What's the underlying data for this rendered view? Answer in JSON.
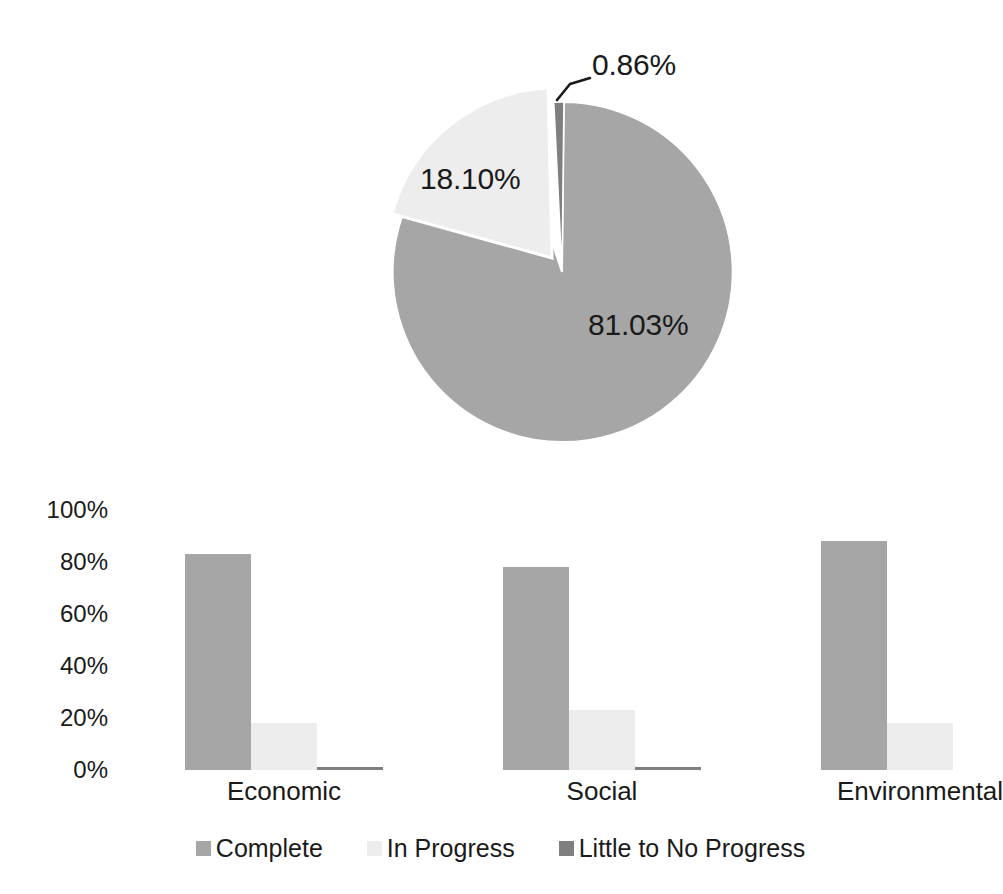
{
  "colors": {
    "complete": "#a6a6a6",
    "in_progress": "#ededed",
    "little_to_no_progress": "#7f7f7f",
    "slice_border": "#ffffff",
    "text": "#1a1a1a",
    "leader_line": "#1a1a1a",
    "background": "#ffffff"
  },
  "legend": {
    "position": "bottom",
    "items": [
      {
        "label": "Complete",
        "color": "#a6a6a6"
      },
      {
        "label": "In Progress",
        "color": "#ededed"
      },
      {
        "label": "Little to No Progress",
        "color": "#7f7f7f"
      }
    ]
  },
  "chart_data": [
    {
      "id": "pie",
      "type": "pie",
      "title": "",
      "exploded": true,
      "labels": [
        "Complete",
        "In Progress",
        "Little to No Progress"
      ],
      "values": [
        81.03,
        18.1,
        0.86
      ],
      "data_labels": [
        "81.03%",
        "18.10%",
        "0.86%"
      ],
      "colors": [
        "#a6a6a6",
        "#ededed",
        "#7f7f7f"
      ],
      "slices": [
        {
          "label": "Complete",
          "value": 81.03,
          "data_label": "81.03%",
          "color": "#a6a6a6",
          "exploded": false,
          "leader_line": false
        },
        {
          "label": "In Progress",
          "value": 18.1,
          "data_label": "18.10%",
          "color": "#ededed",
          "exploded": true,
          "leader_line": false
        },
        {
          "label": "Little to No Progress",
          "value": 0.86,
          "data_label": "0.86%",
          "color": "#7f7f7f",
          "exploded": false,
          "leader_line": true
        }
      ],
      "legend_position": "bottom",
      "units": "percent"
    },
    {
      "id": "bars",
      "type": "bar",
      "title": "",
      "xlabel": "",
      "ylabel": "",
      "categories": [
        "Economic",
        "Social",
        "Environmental"
      ],
      "ylim": [
        0,
        100
      ],
      "yticks": [
        0,
        20,
        40,
        60,
        80,
        100
      ],
      "ytick_labels": [
        "0%",
        "20%",
        "40%",
        "60%",
        "80%",
        "100%"
      ],
      "grid": false,
      "units": "percent",
      "series": [
        {
          "name": "Complete",
          "color": "#a6a6a6",
          "values": [
            83,
            78,
            88
          ]
        },
        {
          "name": "In Progress",
          "color": "#ededed",
          "values": [
            18,
            23,
            18
          ]
        },
        {
          "name": "Little to No Progress",
          "color": "#7f7f7f",
          "values": [
            1,
            1,
            0
          ]
        }
      ]
    }
  ]
}
